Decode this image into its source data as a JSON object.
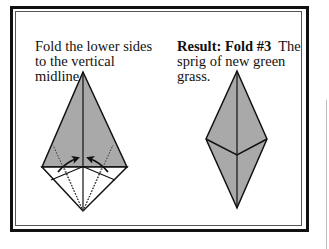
{
  "steps": {
    "left": {
      "instruction": "Fold the lower sides to the vertical midline."
    },
    "right": {
      "result_label": "Result: Fold #3",
      "result_text": "The sprig of new green grass."
    }
  },
  "colors": {
    "paper_fill": "#a9a9a9",
    "stroke": "#111111",
    "border": "#111111"
  }
}
